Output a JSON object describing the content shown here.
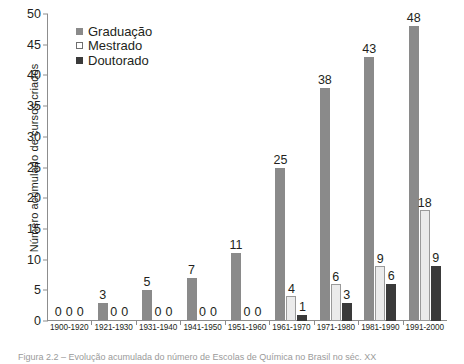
{
  "chart_data": {
    "type": "bar",
    "title": "",
    "xlabel": "",
    "ylabel": "Número acumulado de cursos criados",
    "ylim": [
      0,
      50
    ],
    "yticks": [
      0,
      5,
      10,
      15,
      20,
      25,
      30,
      35,
      40,
      45,
      50
    ],
    "grid": false,
    "legend_position": "top-left",
    "categories": [
      "1900-1920",
      "1921-1930",
      "1931-1940",
      "1941-1950",
      "1951-1960",
      "1961-1970",
      "1971-1980",
      "1981-1990",
      "1991-2000"
    ],
    "series": [
      {
        "name": "Graduação",
        "color": "#8a8a8a",
        "values": [
          0,
          3,
          5,
          7,
          11,
          25,
          38,
          43,
          48
        ]
      },
      {
        "name": "Mestrado",
        "color": "#ebebeb",
        "values": [
          0,
          0,
          0,
          0,
          0,
          4,
          6,
          9,
          18
        ]
      },
      {
        "name": "Doutorado",
        "color": "#3a3a3a",
        "values": [
          0,
          0,
          0,
          0,
          0,
          1,
          3,
          6,
          9
        ]
      }
    ]
  },
  "legend": {
    "items": [
      {
        "label": "Graduação"
      },
      {
        "label": "Mestrado"
      },
      {
        "label": "Doutorado"
      }
    ]
  },
  "caption": {
    "text": "Figura 2.2 – Evolução acumulada do número de Escolas de Química no Brasil no séc. XX"
  }
}
